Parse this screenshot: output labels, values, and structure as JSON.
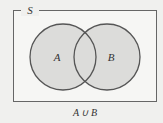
{
  "diagram": {
    "type": "venn",
    "universe_label": "S",
    "sets": [
      {
        "label": "A"
      },
      {
        "label": "B"
      }
    ],
    "caption": "A ∪ B",
    "shaded_region": "A union B",
    "colors": {
      "background": "#f0f0ee",
      "shade": "#dcdcda",
      "stroke": "#555555"
    }
  }
}
